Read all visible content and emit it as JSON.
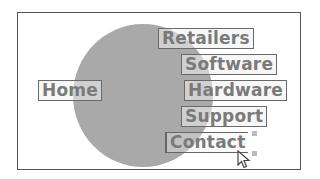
{
  "diagram": {
    "labels": {
      "home": "Home",
      "retailers": "Retailers",
      "software": "Software",
      "hardware": "Hardware",
      "support": "Support",
      "contact": "Contact"
    },
    "colors": {
      "circle": "#a9a9a9",
      "label_text": "#7a7a7a",
      "label_border": "#6a6a6a",
      "frame": "#555555"
    }
  }
}
